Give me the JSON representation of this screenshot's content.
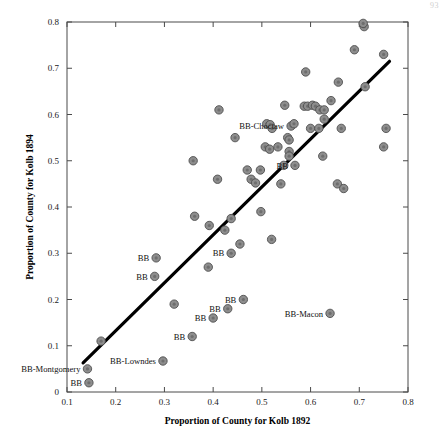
{
  "page": {
    "artifact_text": "93"
  },
  "chart_data": {
    "type": "scatter",
    "title": "",
    "xlabel": "Proportion of County for Kolb 1892",
    "ylabel": "Proportion of County for Kolb 1894",
    "xlim": [
      0.1,
      0.8
    ],
    "ylim": [
      0.0,
      0.8
    ],
    "xticks": [
      0.1,
      0.2,
      0.3,
      0.4,
      0.5,
      0.6,
      0.7,
      0.8
    ],
    "xtick_labels": [
      "0.1",
      "0.2",
      "0.3",
      "0.4",
      "0.5",
      "0.6",
      "0.7",
      "0.8"
    ],
    "yticks": [
      0.0,
      0.1,
      0.2,
      0.3,
      0.4,
      0.5,
      0.6,
      0.7,
      0.8
    ],
    "ytick_labels": [
      "0",
      "0.1",
      "0.2",
      "0.3",
      "0.4",
      "0.5",
      "0.6",
      "0.7",
      "0.8"
    ],
    "grid": false,
    "legend": null,
    "marker": {
      "shape": "circle",
      "face_color": "#8d8d8d",
      "edge_color": "#4f4f4f",
      "size": 4.2
    },
    "fit_line": {
      "label": "regression line",
      "color": "#000000",
      "x": [
        0.133,
        0.762
      ],
      "y": [
        0.063,
        0.715
      ]
    },
    "points": [
      {
        "x": 0.145,
        "y": 0.02
      },
      {
        "x": 0.142,
        "y": 0.05
      },
      {
        "x": 0.17,
        "y": 0.11
      },
      {
        "x": 0.297,
        "y": 0.067
      },
      {
        "x": 0.357,
        "y": 0.12
      },
      {
        "x": 0.4,
        "y": 0.16
      },
      {
        "x": 0.43,
        "y": 0.18
      },
      {
        "x": 0.462,
        "y": 0.2
      },
      {
        "x": 0.32,
        "y": 0.19
      },
      {
        "x": 0.64,
        "y": 0.17
      },
      {
        "x": 0.283,
        "y": 0.29
      },
      {
        "x": 0.28,
        "y": 0.25
      },
      {
        "x": 0.39,
        "y": 0.27
      },
      {
        "x": 0.437,
        "y": 0.3
      },
      {
        "x": 0.424,
        "y": 0.35
      },
      {
        "x": 0.455,
        "y": 0.32
      },
      {
        "x": 0.52,
        "y": 0.33
      },
      {
        "x": 0.362,
        "y": 0.38
      },
      {
        "x": 0.392,
        "y": 0.36
      },
      {
        "x": 0.437,
        "y": 0.375
      },
      {
        "x": 0.498,
        "y": 0.39
      },
      {
        "x": 0.359,
        "y": 0.5
      },
      {
        "x": 0.409,
        "y": 0.46
      },
      {
        "x": 0.47,
        "y": 0.48
      },
      {
        "x": 0.478,
        "y": 0.46
      },
      {
        "x": 0.487,
        "y": 0.452
      },
      {
        "x": 0.497,
        "y": 0.48
      },
      {
        "x": 0.539,
        "y": 0.45
      },
      {
        "x": 0.545,
        "y": 0.49
      },
      {
        "x": 0.568,
        "y": 0.49
      },
      {
        "x": 0.625,
        "y": 0.51
      },
      {
        "x": 0.655,
        "y": 0.45
      },
      {
        "x": 0.668,
        "y": 0.44
      },
      {
        "x": 0.75,
        "y": 0.53
      },
      {
        "x": 0.755,
        "y": 0.57
      },
      {
        "x": 0.507,
        "y": 0.53
      },
      {
        "x": 0.516,
        "y": 0.525
      },
      {
        "x": 0.533,
        "y": 0.53
      },
      {
        "x": 0.553,
        "y": 0.55
      },
      {
        "x": 0.556,
        "y": 0.545
      },
      {
        "x": 0.556,
        "y": 0.52
      },
      {
        "x": 0.556,
        "y": 0.51
      },
      {
        "x": 0.56,
        "y": 0.575
      },
      {
        "x": 0.445,
        "y": 0.55
      },
      {
        "x": 0.51,
        "y": 0.58
      },
      {
        "x": 0.517,
        "y": 0.578
      },
      {
        "x": 0.521,
        "y": 0.57
      },
      {
        "x": 0.566,
        "y": 0.58
      },
      {
        "x": 0.6,
        "y": 0.57
      },
      {
        "x": 0.617,
        "y": 0.57
      },
      {
        "x": 0.628,
        "y": 0.59
      },
      {
        "x": 0.663,
        "y": 0.57
      },
      {
        "x": 0.412,
        "y": 0.61
      },
      {
        "x": 0.547,
        "y": 0.62
      },
      {
        "x": 0.587,
        "y": 0.618
      },
      {
        "x": 0.594,
        "y": 0.618
      },
      {
        "x": 0.604,
        "y": 0.62
      },
      {
        "x": 0.61,
        "y": 0.618
      },
      {
        "x": 0.619,
        "y": 0.61
      },
      {
        "x": 0.628,
        "y": 0.61
      },
      {
        "x": 0.642,
        "y": 0.63
      },
      {
        "x": 0.59,
        "y": 0.692
      },
      {
        "x": 0.657,
        "y": 0.67
      },
      {
        "x": 0.712,
        "y": 0.66
      },
      {
        "x": 0.69,
        "y": 0.74
      },
      {
        "x": 0.75,
        "y": 0.73
      },
      {
        "x": 0.71,
        "y": 0.79
      },
      {
        "x": 0.708,
        "y": 0.797
      }
    ],
    "annotations": [
      {
        "text": "BB-Montgomery",
        "x": 0.142,
        "y": 0.05,
        "anchor": "right"
      },
      {
        "text": "BB",
        "x": 0.145,
        "y": 0.02,
        "anchor": "right"
      },
      {
        "text": "BB-Lowndes",
        "x": 0.297,
        "y": 0.067,
        "anchor": "right"
      },
      {
        "text": "BB",
        "x": 0.357,
        "y": 0.12,
        "anchor": "right"
      },
      {
        "text": "BB",
        "x": 0.4,
        "y": 0.16,
        "anchor": "right"
      },
      {
        "text": "BB",
        "x": 0.43,
        "y": 0.18,
        "anchor": "right"
      },
      {
        "text": "BB",
        "x": 0.462,
        "y": 0.2,
        "anchor": "right"
      },
      {
        "text": "BB-Macon",
        "x": 0.64,
        "y": 0.17,
        "anchor": "right"
      },
      {
        "text": "BB",
        "x": 0.283,
        "y": 0.29,
        "anchor": "right"
      },
      {
        "text": "BB",
        "x": 0.28,
        "y": 0.25,
        "anchor": "right"
      },
      {
        "text": "BB",
        "x": 0.437,
        "y": 0.3,
        "anchor": "right"
      },
      {
        "text": "BB",
        "x": 0.568,
        "y": 0.49,
        "anchor": "right"
      },
      {
        "text": "BB-Choctaw",
        "x": 0.56,
        "y": 0.575,
        "anchor": "right"
      }
    ]
  }
}
